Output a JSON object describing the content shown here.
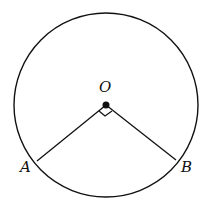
{
  "diagram": {
    "labels": {
      "center": "O",
      "point_a": "A",
      "point_b": "B"
    },
    "angle_AOB_degrees": 90,
    "right_angle_marker": true,
    "colors": {
      "stroke": "#111111",
      "background": "#ffffff"
    }
  }
}
